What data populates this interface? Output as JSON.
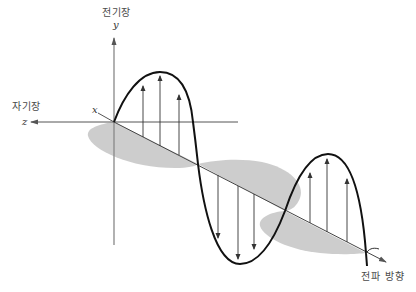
{
  "diagram": {
    "type": "electromagnetic-wave",
    "labels": {
      "electric_field": "전기장",
      "magnetic_field": "자기장",
      "propagation_direction": "전파 방향",
      "axis_x": "x",
      "axis_y": "y",
      "axis_z": "z"
    },
    "colors": {
      "wave_line": "#111111",
      "axis_line": "#888888",
      "magnetic_lobe_fill": "#c8c8c8",
      "arrow_line": "#333333",
      "background": "#ffffff"
    },
    "components": {
      "electric_field_wave": "sinusoid in vertical (y) plane along propagation axis",
      "magnetic_field_wave": "shaded sinusoid in horizontal plane along propagation axis",
      "electric_vectors_up_first_crest": 3,
      "electric_vectors_down_trough": 3,
      "electric_vectors_up_second_crest": 3
    }
  }
}
